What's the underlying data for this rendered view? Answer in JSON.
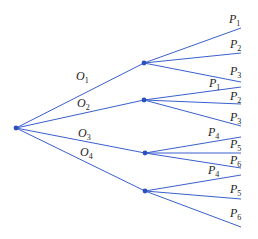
{
  "diagram": {
    "type": "tree",
    "root": {
      "x": 16,
      "y": 128
    },
    "level1": [
      {
        "label": "O",
        "sub": "1",
        "node": {
          "x": 144,
          "y": 63
        },
        "label_pos": {
          "x": 76,
          "y": 80
        },
        "children": [
          {
            "label": "P",
            "sub": "1",
            "end": {
              "x": 241,
              "y": 28
            },
            "label_pos": {
              "x": 229,
              "y": 23
            }
          },
          {
            "label": "P",
            "sub": "2",
            "end": {
              "x": 241,
              "y": 53
            },
            "label_pos": {
              "x": 230,
              "y": 48
            }
          },
          {
            "label": "P",
            "sub": "3",
            "end": {
              "x": 241,
              "y": 82
            },
            "label_pos": {
              "x": 230,
              "y": 75
            }
          }
        ]
      },
      {
        "label": "O",
        "sub": "2",
        "node": {
          "x": 144,
          "y": 100
        },
        "label_pos": {
          "x": 77,
          "y": 107
        },
        "children": [
          {
            "label": "P",
            "sub": "1",
            "end": {
              "x": 241,
              "y": 87
            },
            "label_pos": {
              "x": 209,
              "y": 87
            }
          },
          {
            "label": "P",
            "sub": "2",
            "end": {
              "x": 241,
              "y": 104
            },
            "label_pos": {
              "x": 230,
              "y": 100
            }
          },
          {
            "label": "P",
            "sub": "3",
            "end": {
              "x": 241,
              "y": 126
            },
            "label_pos": {
              "x": 230,
              "y": 121
            }
          }
        ]
      },
      {
        "label": "O",
        "sub": "3",
        "node": {
          "x": 145,
          "y": 153
        },
        "label_pos": {
          "x": 78,
          "y": 137
        },
        "children": [
          {
            "label": "P",
            "sub": "4",
            "end": {
              "x": 241,
              "y": 137
            },
            "label_pos": {
              "x": 208,
              "y": 136
            }
          },
          {
            "label": "P",
            "sub": "5",
            "end": {
              "x": 241,
              "y": 153
            },
            "label_pos": {
              "x": 230,
              "y": 148
            }
          },
          {
            "label": "P",
            "sub": "6",
            "end": {
              "x": 241,
              "y": 168
            },
            "label_pos": {
              "x": 230,
              "y": 164
            }
          }
        ]
      },
      {
        "label": "O",
        "sub": "4",
        "node": {
          "x": 145,
          "y": 191
        },
        "label_pos": {
          "x": 80,
          "y": 156
        },
        "children": [
          {
            "label": "P",
            "sub": "4",
            "end": {
              "x": 241,
              "y": 175
            },
            "label_pos": {
              "x": 208,
              "y": 174
            }
          },
          {
            "label": "P",
            "sub": "5",
            "end": {
              "x": 241,
              "y": 199
            },
            "label_pos": {
              "x": 230,
              "y": 193
            }
          },
          {
            "label": "P",
            "sub": "6",
            "end": {
              "x": 241,
              "y": 227
            },
            "label_pos": {
              "x": 230,
              "y": 217
            }
          }
        ]
      }
    ],
    "colors": {
      "edge": "#3a5fcd",
      "node": "#2a4fc0",
      "text": "#222222"
    }
  }
}
